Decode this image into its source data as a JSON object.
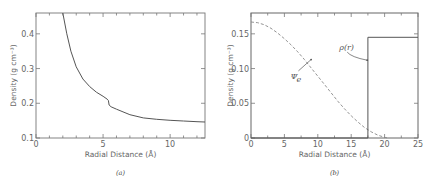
{
  "chart_data": [
    {
      "id": "a",
      "type": "line",
      "caption": "(a)",
      "title": "",
      "xlabel": "Radial Distance (Å)",
      "ylabel": "Density (g cm⁻³)",
      "xlim": [
        0,
        12.6
      ],
      "ylim": [
        0.1,
        0.46
      ],
      "xticks": [
        0,
        5,
        10
      ],
      "xtick_labels": [
        "0",
        "5",
        "10"
      ],
      "yticks": [
        0.1,
        0.2,
        0.3,
        0.4
      ],
      "ytick_labels": [
        "0.1",
        "0.2",
        "0.3",
        "0.4"
      ],
      "grid": false,
      "series": [
        {
          "name": "density",
          "style": "solid",
          "color": "#555555",
          "x": [
            2.0,
            2.3,
            2.6,
            3.0,
            3.5,
            4.0,
            4.5,
            5.0,
            5.3,
            5.4,
            5.45,
            5.6,
            6.0,
            7.0,
            8.0,
            9.0,
            10.0,
            11.0,
            12.0,
            12.6
          ],
          "y": [
            0.46,
            0.4,
            0.35,
            0.305,
            0.27,
            0.248,
            0.232,
            0.22,
            0.212,
            0.208,
            0.195,
            0.19,
            0.183,
            0.167,
            0.158,
            0.154,
            0.151,
            0.149,
            0.147,
            0.146
          ]
        }
      ]
    },
    {
      "id": "b",
      "type": "line",
      "caption": "(b)",
      "title": "",
      "xlabel": "Radial Distance (Å)",
      "ylabel": "Density (g cm⁻³)",
      "xlim": [
        0,
        25
      ],
      "ylim": [
        0,
        0.18
      ],
      "xticks": [
        0,
        5,
        10,
        15,
        20,
        25
      ],
      "xtick_labels": [
        "0",
        "5",
        "10",
        "15",
        "20",
        "25"
      ],
      "yticks": [
        0,
        0.05,
        0.1,
        0.15
      ],
      "ytick_labels": [
        "0",
        "0.05",
        "0.10",
        "0.15"
      ],
      "grid": false,
      "series": [
        {
          "name": "Ψe",
          "style": "dashed",
          "color": "#888888",
          "x": [
            0,
            1,
            2,
            3,
            4,
            5,
            6,
            7,
            8,
            9,
            10,
            11,
            12,
            13,
            14,
            15,
            16,
            17,
            18,
            19,
            20,
            20.5
          ],
          "y": [
            0.167,
            0.166,
            0.163,
            0.158,
            0.151,
            0.143,
            0.134,
            0.124,
            0.113,
            0.101,
            0.089,
            0.077,
            0.065,
            0.053,
            0.042,
            0.032,
            0.023,
            0.015,
            0.009,
            0.004,
            0.001,
            0.0
          ]
        },
        {
          "name": "ρ(r)",
          "style": "solid",
          "color": "#555555",
          "x": [
            0,
            17.5,
            17.5,
            25
          ],
          "y": [
            0,
            0,
            0.145,
            0.145
          ]
        }
      ],
      "annotations": [
        {
          "text": "Ψe",
          "label_x": 6.5,
          "label_y": 0.088,
          "arrow_to_x": 9.0,
          "arrow_to_y": 0.113
        },
        {
          "text": "ρ(r)",
          "label_x": 13.5,
          "label_y": 0.128,
          "arrow_to_x": 17.4,
          "arrow_to_y": 0.112
        }
      ]
    }
  ],
  "figure": {
    "caption_a": "(a)",
    "caption_b": "(b)",
    "xlabel_a": "Radial Distance (Å)",
    "ylabel_a": "Density (g cm⁻³)",
    "xlabel_b": "Radial Distance (Å)",
    "ylabel_b": "Density (g cm⁻³)",
    "annot_psi": "Ψ",
    "annot_psi_sub": "e",
    "annot_rho": "ρ(r)"
  }
}
